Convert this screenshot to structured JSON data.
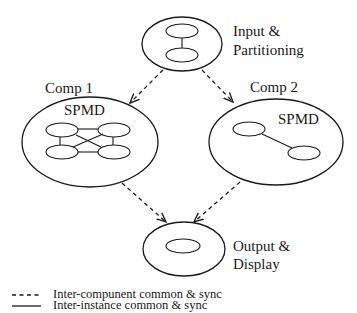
{
  "diagram": {
    "nodes": {
      "input": {
        "label_line1": "Input &",
        "label_line2": "Partitioning"
      },
      "comp1": {
        "title": "Comp 1",
        "inner_label": "SPMD"
      },
      "comp2": {
        "title": "Comp 2",
        "inner_label": "SPMD"
      },
      "output": {
        "label_line1": "Output &",
        "label_line2": "Display"
      }
    },
    "edges": [
      {
        "from": "input",
        "to": "comp1",
        "style": "dashed"
      },
      {
        "from": "input",
        "to": "comp2",
        "style": "dashed"
      },
      {
        "from": "comp1",
        "to": "output",
        "style": "dashed"
      },
      {
        "from": "comp2",
        "to": "output",
        "style": "dashed"
      }
    ],
    "legend": {
      "dashed": "Inter-compunent common & sync",
      "solid": "Inter-instance common & sync"
    }
  }
}
